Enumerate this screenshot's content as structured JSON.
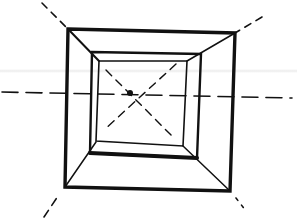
{
  "diagram": {
    "title": "",
    "stroke_color": "#111111",
    "background_color": "#ffffff",
    "elements": [
      {
        "name": "outer-square",
        "style": "solid-thick"
      },
      {
        "name": "middle-square",
        "style": "solid"
      },
      {
        "name": "inner-square",
        "style": "solid-thin"
      },
      {
        "name": "vanishing-point",
        "style": "dot"
      },
      {
        "name": "horizon-line",
        "style": "dashed"
      },
      {
        "name": "diagonal-construction-lines",
        "style": "dashed"
      }
    ]
  }
}
